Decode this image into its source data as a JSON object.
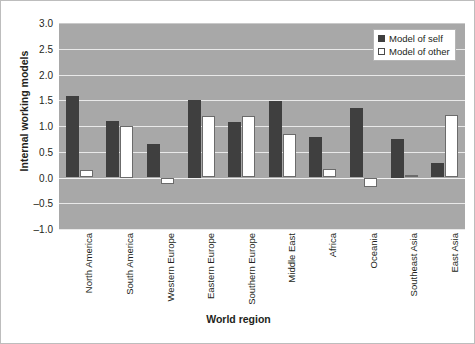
{
  "chart_data": {
    "type": "bar",
    "title": "",
    "xlabel": "World region",
    "ylabel": "Internal working models",
    "ylim": [
      -1.0,
      3.0
    ],
    "ytick_labels": [
      "3.0",
      "2.5",
      "2.0",
      "1.5",
      "1.0",
      "0.5",
      "0.0",
      "–0.5",
      "–1.0"
    ],
    "ytick_values": [
      3.0,
      2.5,
      2.0,
      1.5,
      1.0,
      0.5,
      0.0,
      -0.5,
      -1.0
    ],
    "grid": true,
    "legend_position": "top-right",
    "categories": [
      "North America",
      "South America",
      "Western Europe",
      "Eastern Europe",
      "Southern Europe",
      "Middle East",
      "Africa",
      "Oceania",
      "Southeast Asia",
      "East Asia"
    ],
    "series": [
      {
        "name": "Model of self",
        "color": "#3f3f3f",
        "values": [
          1.58,
          1.1,
          0.65,
          1.5,
          1.08,
          1.48,
          0.78,
          1.35,
          0.75,
          0.28
        ]
      },
      {
        "name": "Model of other",
        "color": "#ffffff",
        "values": [
          0.15,
          1.0,
          -0.12,
          1.2,
          1.2,
          0.85,
          0.17,
          -0.18,
          0.05,
          1.22
        ]
      }
    ],
    "plot_background": "#a8a8a8",
    "gridline_color": "#e9e9e9"
  },
  "legend": {
    "items": [
      {
        "label": "Model of self"
      },
      {
        "label": "Model of other"
      }
    ]
  }
}
